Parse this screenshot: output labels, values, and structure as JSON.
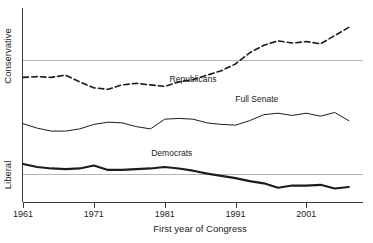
{
  "chart_data": {
    "type": "line",
    "title": "",
    "xlabel": "First year of Congress",
    "ylabel_top": "Conservative",
    "ylabel_bottom": "Liberal",
    "xlim": [
      1961,
      2009
    ],
    "ylim": [
      -0.55,
      0.75
    ],
    "grid": "two horizontal reference gridlines only",
    "legend": "inline series labels on plot",
    "xticks": [
      1961,
      1971,
      1981,
      1991,
      2001
    ],
    "xtick_labels": [
      "1961",
      "1971",
      "1981",
      "1991",
      "2001"
    ],
    "yticks": [],
    "ytick_labels": [],
    "gridlines_y": [
      0.4,
      -0.36
    ],
    "x": [
      1961,
      1963,
      1965,
      1967,
      1969,
      1971,
      1973,
      1975,
      1977,
      1979,
      1981,
      1983,
      1985,
      1987,
      1989,
      1991,
      1993,
      1995,
      1997,
      1999,
      2001,
      2003,
      2005,
      2007
    ],
    "series": [
      {
        "name": "Republicans",
        "style": "dashed",
        "label_x": 1985,
        "label_y": 0.255,
        "values": [
          0.285,
          0.29,
          0.285,
          0.3,
          0.255,
          0.215,
          0.205,
          0.235,
          0.245,
          0.235,
          0.225,
          0.255,
          0.27,
          0.3,
          0.33,
          0.375,
          0.45,
          0.5,
          0.53,
          0.515,
          0.525,
          0.51,
          0.565,
          0.62
        ]
      },
      {
        "name": "Full Senate",
        "style": "solid-thin",
        "label_x": 1994,
        "label_y": 0.12,
        "values": [
          -0.025,
          -0.055,
          -0.075,
          -0.075,
          -0.06,
          -0.03,
          -0.015,
          -0.02,
          -0.045,
          -0.06,
          0.005,
          0.01,
          0.005,
          -0.02,
          -0.03,
          -0.035,
          -0.005,
          0.035,
          0.045,
          0.03,
          0.045,
          0.025,
          0.05,
          -0.005
        ]
      },
      {
        "name": "Democrats",
        "style": "solid-thick",
        "label_x": 1982,
        "label_y": -0.245,
        "values": [
          -0.295,
          -0.315,
          -0.325,
          -0.33,
          -0.325,
          -0.305,
          -0.335,
          -0.335,
          -0.33,
          -0.325,
          -0.315,
          -0.325,
          -0.34,
          -0.36,
          -0.375,
          -0.39,
          -0.41,
          -0.425,
          -0.455,
          -0.44,
          -0.44,
          -0.435,
          -0.46,
          -0.45
        ]
      }
    ]
  },
  "axis": {
    "x_title": "First year of Congress",
    "y_top_label": "Conservative",
    "y_bottom_label": "Liberal"
  },
  "colors": {
    "line": "#1c1c1c",
    "axis": "#3a3a3a",
    "grid": "#b4b4b4",
    "background": "#ffffff"
  }
}
